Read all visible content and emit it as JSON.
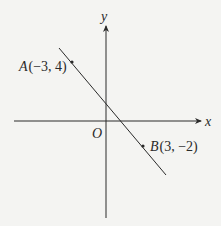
{
  "diagram": {
    "axes": {
      "x_label": "x",
      "y_label": "y",
      "origin_label": "O"
    },
    "points": [
      {
        "name": "A",
        "coords": "(−3, 4)",
        "x": -3,
        "y": 4
      },
      {
        "name": "B",
        "coords": "(3, −2)",
        "x": 3,
        "y": -2
      }
    ],
    "line": {
      "through": [
        "A",
        "B"
      ]
    },
    "colors": {
      "ink": "#2a2a2a",
      "background": "#f4f4f2"
    }
  }
}
